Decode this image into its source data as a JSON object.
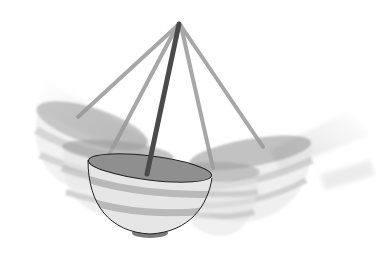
{
  "illustration": {
    "subject": "swinging bowl hanging from a stick pivot with motion-blur ghost positions",
    "colors": {
      "background": "#ffffff",
      "stick": "#4a4a4a",
      "bowl_inner": "#8e8e8e",
      "bowl_body": "#e6e6e6",
      "bowl_stripe": "#b8b8b8",
      "outline": "#222222",
      "ghost": "#9a9a9a"
    },
    "pivot": {
      "x": 179,
      "y": 24
    }
  }
}
